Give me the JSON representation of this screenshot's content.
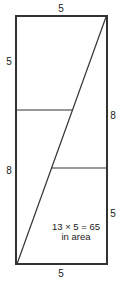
{
  "diagram": {
    "labels": {
      "top": "5",
      "left_upper": "5",
      "left_lower": "8",
      "right_upper": "8",
      "right_lower": "5",
      "bottom": "5"
    },
    "area_note": {
      "line1": "13 × 5 = 65",
      "line2": "in area"
    },
    "colors": {
      "stroke": "#333333",
      "text": "#222222",
      "background": "#ffffff"
    }
  }
}
